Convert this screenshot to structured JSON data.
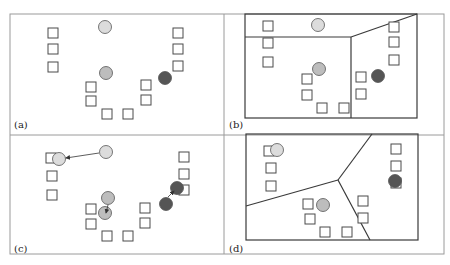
{
  "figure": {
    "colors": {
      "frame": "#9a9a9a",
      "line": "#3a3a3a",
      "square_stroke": "#4a4a4a",
      "square_fill": "#ffffff",
      "circle_light": "#dcdcdc",
      "circle_medium": "#bdbdbd",
      "circle_dark": "#555555",
      "circle_stroke": "#555555"
    },
    "panels": [
      {
        "id": "a",
        "label": "(a)",
        "label_pos": [
          14,
          128
        ],
        "squares": [
          [
            53,
            33
          ],
          [
            53,
            49
          ],
          [
            53,
            67
          ],
          [
            91,
            87
          ],
          [
            91,
            101
          ],
          [
            107,
            114
          ],
          [
            128,
            114
          ],
          [
            146,
            85
          ],
          [
            146,
            100
          ],
          [
            178,
            33
          ],
          [
            178,
            49
          ],
          [
            178,
            66
          ]
        ],
        "circles": [
          {
            "x": 105,
            "y": 27,
            "tone": "light"
          },
          {
            "x": 106,
            "y": 73,
            "tone": "medium"
          },
          {
            "x": 165,
            "y": 78,
            "tone": "dark"
          }
        ],
        "arrows": [],
        "boundary": null
      },
      {
        "id": "b",
        "label": "(b)",
        "label_pos": [
          229,
          128
        ],
        "squares": [
          [
            268,
            26
          ],
          [
            268,
            43
          ],
          [
            268,
            62
          ],
          [
            307,
            79
          ],
          [
            307,
            95
          ],
          [
            322,
            108
          ],
          [
            344,
            108
          ],
          [
            361,
            77
          ],
          [
            361,
            94
          ],
          [
            394,
            27
          ],
          [
            394,
            42
          ],
          [
            394,
            60
          ]
        ],
        "circles": [
          {
            "x": 318,
            "y": 25,
            "tone": "light"
          },
          {
            "x": 319,
            "y": 69,
            "tone": "medium"
          },
          {
            "x": 378,
            "y": 76,
            "tone": "dark"
          }
        ],
        "arrows": [],
        "boundary": {
          "box": [
            245,
            14,
            417,
            118
          ],
          "segments": [
            [
              245,
              37,
              351,
              37
            ],
            [
              351,
              37,
              417,
              14
            ],
            [
              351,
              37,
              351,
              118
            ]
          ]
        }
      },
      {
        "id": "c",
        "label": "(c)",
        "label_pos": [
          14,
          252
        ],
        "squares": [
          [
            51,
            158
          ],
          [
            52,
            176
          ],
          [
            52,
            195
          ],
          [
            91,
            209
          ],
          [
            91,
            224
          ],
          [
            107,
            236
          ],
          [
            128,
            236
          ],
          [
            145,
            208
          ],
          [
            145,
            223
          ],
          [
            184,
            157
          ],
          [
            184,
            174
          ],
          [
            184,
            190
          ]
        ],
        "circles": [
          {
            "x": 106,
            "y": 152,
            "tone": "light"
          },
          {
            "x": 59,
            "y": 159,
            "tone": "light"
          },
          {
            "x": 108,
            "y": 198,
            "tone": "medium"
          },
          {
            "x": 105,
            "y": 213,
            "tone": "medium"
          },
          {
            "x": 166,
            "y": 204,
            "tone": "dark"
          },
          {
            "x": 177,
            "y": 188,
            "tone": "dark"
          }
        ],
        "arrows": [
          {
            "from": [
              99,
              153
            ],
            "to": [
              66,
              158
            ]
          },
          {
            "from": [
              108,
              205
            ],
            "to": [
              106,
              213
            ]
          },
          {
            "from": [
              168,
              197
            ],
            "to": [
              174,
              191
            ]
          }
        ],
        "boundary": null
      },
      {
        "id": "d",
        "label": "(d)",
        "label_pos": [
          229,
          252
        ],
        "squares": [
          [
            269,
            151
          ],
          [
            271,
            168
          ],
          [
            271,
            186
          ],
          [
            308,
            204
          ],
          [
            310,
            219
          ],
          [
            325,
            232
          ],
          [
            347,
            232
          ],
          [
            363,
            201
          ],
          [
            363,
            218
          ],
          [
            396,
            149
          ],
          [
            396,
            166
          ],
          [
            396,
            183
          ]
        ],
        "circles": [
          {
            "x": 277,
            "y": 150,
            "tone": "light"
          },
          {
            "x": 323,
            "y": 205,
            "tone": "medium"
          },
          {
            "x": 395,
            "y": 181,
            "tone": "dark"
          }
        ],
        "arrows": [],
        "boundary": {
          "box": [
            246,
            134,
            418,
            240
          ],
          "segments": [
            [
              338,
              180,
              372,
              134
            ],
            [
              338,
              180,
              246,
              206
            ],
            [
              338,
              180,
              370,
              240
            ]
          ]
        }
      }
    ],
    "grid": {
      "outer": [
        10,
        14,
        444,
        254
      ],
      "mid_x": 224,
      "mid_y": 135
    }
  }
}
